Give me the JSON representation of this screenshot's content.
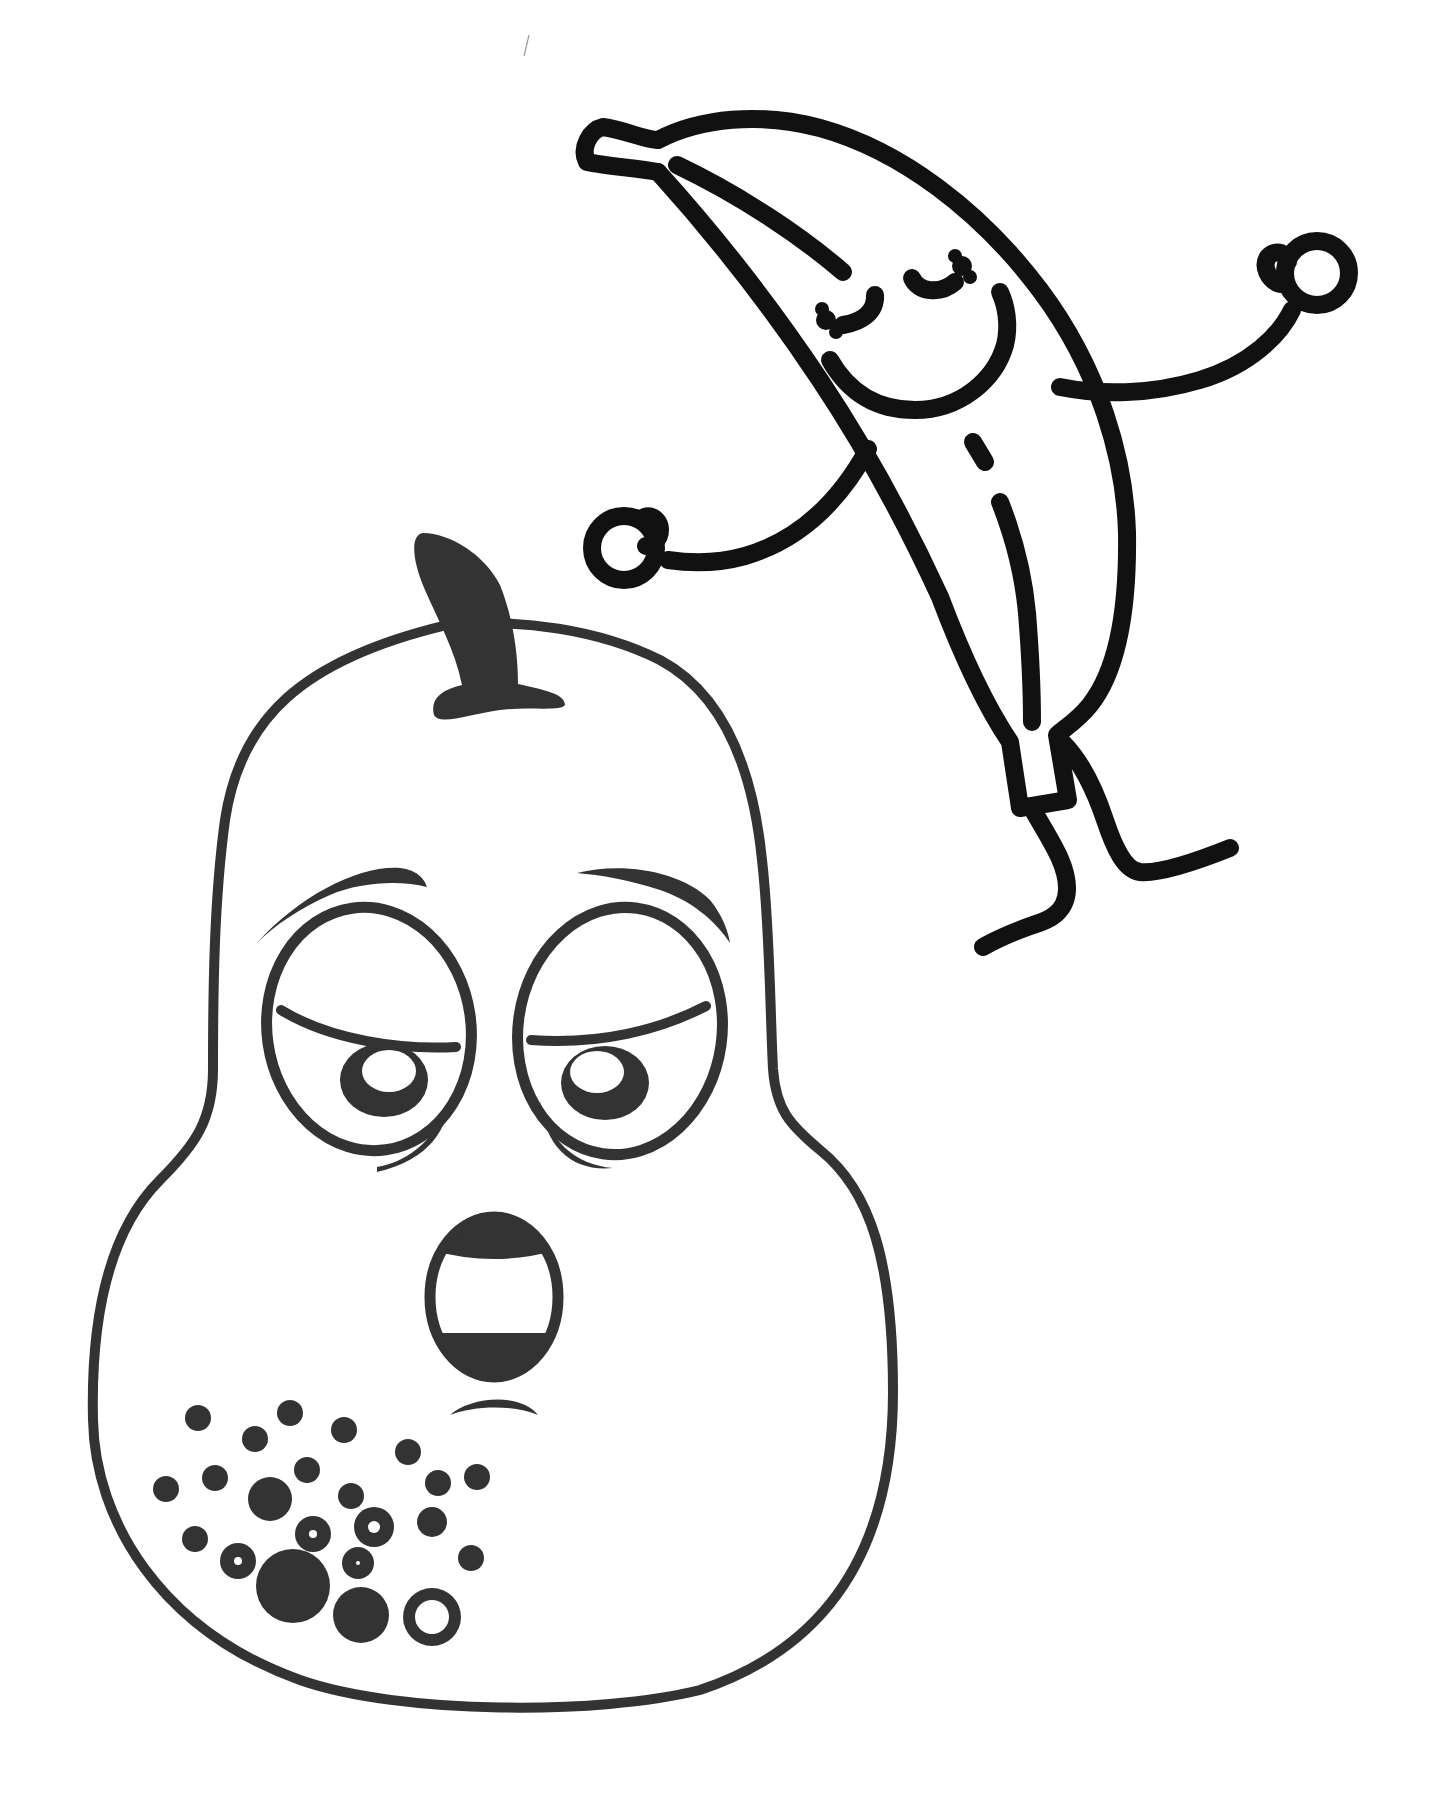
{
  "page": {
    "background": "#ffffff",
    "width": 1436,
    "height": 1804
  },
  "colors": {
    "banana_line": "#111111",
    "pear_line": "#333333",
    "paper": "#ffffff"
  },
  "characters": [
    {
      "id": "pear",
      "label": "Tired pear with surprised open mouth"
    },
    {
      "id": "banana",
      "label": "Dancing banana with closed happy eyes"
    }
  ],
  "pear": {
    "outline": "M 447 625 C 520 618 600 630 660 660 C 720 692 752 760 762 860 C 770 930 770 1010 773 1069 C 776 1110 790 1125 820 1150 C 870 1190 893 1260 893 1392 C 893 1520 850 1640 700 1690 C 600 1715 400 1715 300 1680 C 160 1630 95 1520 93 1420 C 90 1290 120 1220 160 1180 C 195 1145 213 1120 213 1069 C 213 990 214 900 225 820 C 240 720 300 660 447 625 Z",
    "stem": "M 423 533 C 410 535 412 560 425 590 C 438 620 455 650 462 685 C 440 690 430 700 434 715 C 440 726 470 714 500 710 C 530 706 560 712 565 705 C 565 694 545 690 518 684 C 518 650 512 615 500 585 C 485 555 450 533 423 533 Z",
    "left_eye": {
      "ring": {
        "cx": 369,
        "cy": 1029,
        "rx": 102,
        "ry": 122,
        "rotate": -8
      },
      "brow": "M 257 943 C 300 895 360 865 400 868 C 418 870 425 880 427 887 C 400 880 360 882 330 895 C 300 908 275 925 257 943 Z",
      "lid": "M 281 1010 C 330 1040 400 1050 456 1047",
      "iris": {
        "cx": 384,
        "cy": 1080,
        "rx": 44,
        "ry": 37
      },
      "highlight": {
        "cx": 389,
        "cy": 1071,
        "rx": 27,
        "ry": 21
      },
      "bag": "M 377 1167 C 410 1162 440 1135 450 1097 C 448 1128 430 1160 377 1172 Z"
    },
    "right_eye": {
      "ring": {
        "cx": 620,
        "cy": 1031,
        "rx": 102,
        "ry": 124,
        "rotate": 8
      },
      "brow": "M 577 873 C 620 862 680 870 710 900 C 722 915 728 930 730 943 C 715 920 690 900 660 890 C 630 880 600 875 577 873 Z",
      "lid": "M 531 1040 C 600 1045 660 1030 706 1006",
      "iris": {
        "cx": 605,
        "cy": 1083,
        "rx": 44,
        "ry": 37
      },
      "highlight": {
        "cx": 597,
        "cy": 1072,
        "rx": 27,
        "ry": 21
      },
      "bag": "M 540 1100 C 548 1140 575 1165 613 1168 C 575 1172 545 1150 540 1100 Z"
    },
    "mouth": {
      "cx": 494,
      "cy": 1297,
      "rx": 64,
      "ry": 80,
      "upper_teeth_bottom": 1262,
      "lower_teeth_top": 1333
    },
    "frown": "M 450 1415 C 470 1397 520 1392 538 1415 C 515 1405 475 1405 450 1415 Z",
    "spots": [
      {
        "cx": 198,
        "cy": 1418,
        "r": 13,
        "hole": 0
      },
      {
        "cx": 290,
        "cy": 1413,
        "r": 13,
        "hole": 0
      },
      {
        "cx": 255,
        "cy": 1439,
        "r": 13,
        "hole": 0
      },
      {
        "cx": 344,
        "cy": 1430,
        "r": 13,
        "hole": 0
      },
      {
        "cx": 408,
        "cy": 1452,
        "r": 13,
        "hole": 0
      },
      {
        "cx": 166,
        "cy": 1489,
        "r": 13,
        "hole": 0
      },
      {
        "cx": 215,
        "cy": 1478,
        "r": 13,
        "hole": 0
      },
      {
        "cx": 307,
        "cy": 1470,
        "r": 13,
        "hole": 0
      },
      {
        "cx": 270,
        "cy": 1499,
        "r": 22,
        "hole": 0
      },
      {
        "cx": 351,
        "cy": 1496,
        "r": 13,
        "hole": 0
      },
      {
        "cx": 438,
        "cy": 1483,
        "r": 13,
        "hole": 0
      },
      {
        "cx": 477,
        "cy": 1477,
        "r": 13,
        "hole": 0
      },
      {
        "cx": 195,
        "cy": 1539,
        "r": 13,
        "hole": 0
      },
      {
        "cx": 313,
        "cy": 1534,
        "r": 18,
        "hole": 4
      },
      {
        "cx": 374,
        "cy": 1527,
        "r": 20,
        "hole": 6
      },
      {
        "cx": 432,
        "cy": 1522,
        "r": 15,
        "hole": 0
      },
      {
        "cx": 238,
        "cy": 1561,
        "r": 18,
        "hole": 4
      },
      {
        "cx": 358,
        "cy": 1563,
        "r": 16,
        "hole": 2
      },
      {
        "cx": 471,
        "cy": 1558,
        "r": 13,
        "hole": 0
      },
      {
        "cx": 293,
        "cy": 1586,
        "r": 37,
        "hole": 0
      },
      {
        "cx": 361,
        "cy": 1615,
        "r": 28,
        "hole": 0
      },
      {
        "cx": 432,
        "cy": 1617,
        "r": 29,
        "hole": 17
      }
    ]
  },
  "banana": {
    "body": "M 658 140 C 700 118 760 112 820 128 C 900 150 980 210 1040 290 C 1100 370 1125 460 1127 533 C 1128 600 1120 667 1090 705 C 1078 720 1065 728 1057 735 L 1068 800 L 1020 808 L 1010 742 C 985 705 960 650 940 597 C 900 510 860 440 820 380 C 770 305 715 235 658 172",
    "tip": "M 658 172 C 635 168 605 166 587 162 C 580 148 590 130 603 127 C 625 130 645 140 658 140",
    "inner_line": "M 677 165 C 740 195 800 235 843 272",
    "dash": "M 973 442 L 985 462",
    "long_line": "M 1000 502 C 1015 540 1024 580 1027 613 C 1030 650 1032 690 1032 722",
    "closed_eye_left": "M 875 295 C 876 312 862 322 843 325",
    "closed_eye_right": "M 912 278 C 918 292 940 295 955 282",
    "lashes": [
      {
        "cx": 826,
        "cy": 320,
        "r": 10
      },
      {
        "cx": 836,
        "cy": 332,
        "r": 7
      },
      {
        "cx": 822,
        "cy": 309,
        "r": 7
      },
      {
        "cx": 962,
        "cy": 266,
        "r": 10
      },
      {
        "cx": 970,
        "cy": 277,
        "r": 7
      },
      {
        "cx": 955,
        "cy": 256,
        "r": 7
      }
    ],
    "smile": "M 830 360 C 850 395 880 410 915 410 C 960 410 995 380 1005 345 C 1010 325 1006 305 1000 292",
    "left_arm": "M 868 449 C 840 500 800 540 745 556 C 720 563 695 564 668 560",
    "left_hand": {
      "cx": 624,
      "cy": 548,
      "r": 32
    },
    "left_thumb": "M 640 520 C 648 512 660 518 660 530 C 660 540 652 545 646 546",
    "right_arm": "M 1060 387 C 1100 395 1150 395 1200 380 C 1250 365 1280 335 1292 310",
    "right_hand": {
      "cx": 1317,
      "cy": 273,
      "r": 32
    },
    "right_thumb": "M 1280 284 C 1268 280 1262 266 1268 257 C 1276 248 1288 254 1288 262",
    "left_leg": "M 1033 810 C 1050 840 1068 865 1067 890 C 1066 912 1050 920 1033 925 C 1010 933 995 940 983 947",
    "right_leg": "M 1063 743 C 1080 760 1095 790 1105 820 C 1115 850 1125 870 1140 872 C 1160 874 1200 860 1230 848"
  },
  "stray_mark": "M 529 35 L 524 56"
}
